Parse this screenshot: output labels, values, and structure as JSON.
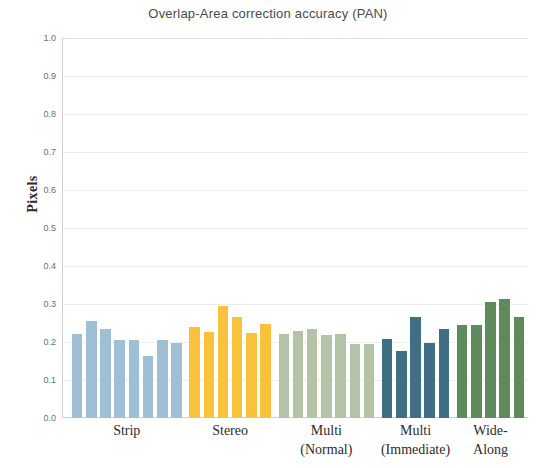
{
  "chart_data": {
    "type": "bar",
    "title": "Overlap-Area correction accuracy (PAN)",
    "xlabel": "",
    "ylabel": "Pixels",
    "ylim": [
      0.0,
      1.0
    ],
    "ytick_labels": [
      "1.0",
      "0.9",
      "0.8",
      "0.7",
      "0.6",
      "0.5",
      "0.4",
      "0.3",
      "0.2",
      "0.1",
      "0.0"
    ],
    "ytick_values": [
      1.0,
      0.9,
      0.8,
      0.7,
      0.6,
      0.5,
      0.4,
      0.3,
      0.2,
      0.1,
      0.0
    ],
    "grid": true,
    "legend": "none",
    "categories": [
      "Strip",
      "Stereo",
      "Multi (Normal)",
      "Multi (Immediate)",
      "Wide-Along"
    ],
    "groups": [
      {
        "name": "Strip",
        "label_line1": "Strip",
        "label_line2": "",
        "color": "#9fc0d4",
        "values": [
          0.22,
          0.255,
          0.235,
          0.205,
          0.205,
          0.163,
          0.205,
          0.198
        ]
      },
      {
        "name": "Stereo",
        "label_line1": "Stereo",
        "label_line2": "",
        "color": "#f9c13c",
        "values": [
          0.24,
          0.226,
          0.294,
          0.265,
          0.224,
          0.247
        ]
      },
      {
        "name": "Multi (Normal)",
        "label_line1": "Multi",
        "label_line2": "(Normal)",
        "color": "#b4c3a8",
        "values": [
          0.221,
          0.229,
          0.234,
          0.218,
          0.221,
          0.196,
          0.195
        ]
      },
      {
        "name": "Multi (Immediate)",
        "label_line1": "Multi",
        "label_line2": "(Immediate)",
        "color": "#3f6e85",
        "values": [
          0.209,
          0.176,
          0.265,
          0.197,
          0.234
        ]
      },
      {
        "name": "Wide-Along",
        "label_line1": "Wide-",
        "label_line2": "Along",
        "color": "#5e8a5c",
        "values": [
          0.246,
          0.245,
          0.304,
          0.313,
          0.265
        ]
      }
    ]
  }
}
